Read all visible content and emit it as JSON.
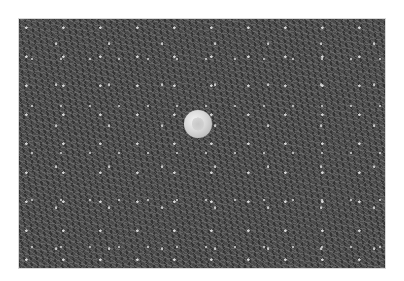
{
  "image": {
    "description": "Grayscale photograph of dense turfgrass with a coin placed near the center for scale",
    "subject": "turfgrass",
    "scale_reference": "coin",
    "colors": {
      "background": "#ffffff",
      "grass_tone": "#4a4a4a",
      "coin_tone": "#d8d8d8"
    }
  }
}
